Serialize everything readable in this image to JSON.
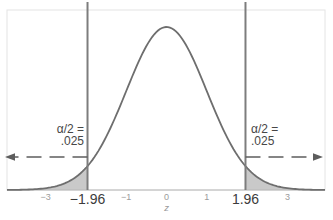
{
  "chart_data": {
    "type": "area",
    "title": "",
    "distribution": "standard normal density",
    "xlabel": "z",
    "x_range": [
      -3.96,
      3.93
    ],
    "alpha": 0.05,
    "tail_area_each": 0.025,
    "critical_values": [
      -1.96,
      1.96
    ],
    "shaded_regions": [
      [
        -3.96,
        -1.96
      ],
      [
        1.96,
        3.93
      ]
    ],
    "grid": false,
    "x_ticks": [
      {
        "value": -3,
        "label": "−3",
        "emphasis": false
      },
      {
        "value": -1.96,
        "label": "−1.96",
        "emphasis": true
      },
      {
        "value": -1,
        "label": "−1",
        "emphasis": false
      },
      {
        "value": 0,
        "label": "0",
        "emphasis": false
      },
      {
        "value": 1,
        "label": "1",
        "emphasis": false
      },
      {
        "value": 1.96,
        "label": "1.96",
        "emphasis": true
      },
      {
        "value": 3,
        "label": "3",
        "emphasis": false
      }
    ],
    "annotations": {
      "left_tail": {
        "line1": "α/2 =",
        "line2": ".025"
      },
      "right_tail": {
        "line1": "α/2 =",
        "line2": ".025"
      }
    },
    "colors": {
      "curve": "#6e6e6e",
      "critical_line": "#7d7d7d",
      "shade": "#c9c9c9",
      "arrow": "#5d5d5d",
      "annotation_text": "#474747",
      "tick_emphasis": "#3c3c3c",
      "tick_small": "#9b9b9b",
      "baseline": "#b8b8b8",
      "frame": "#e4e4e4"
    },
    "layout": {
      "center_x": 166.5,
      "px_per_unit": 40.3,
      "baseline_y": 190,
      "peak_y": 27,
      "frame_top": 10,
      "frame_left": 7,
      "frame_right": 325,
      "vline_top": 2,
      "arrow_y": 157
    }
  }
}
